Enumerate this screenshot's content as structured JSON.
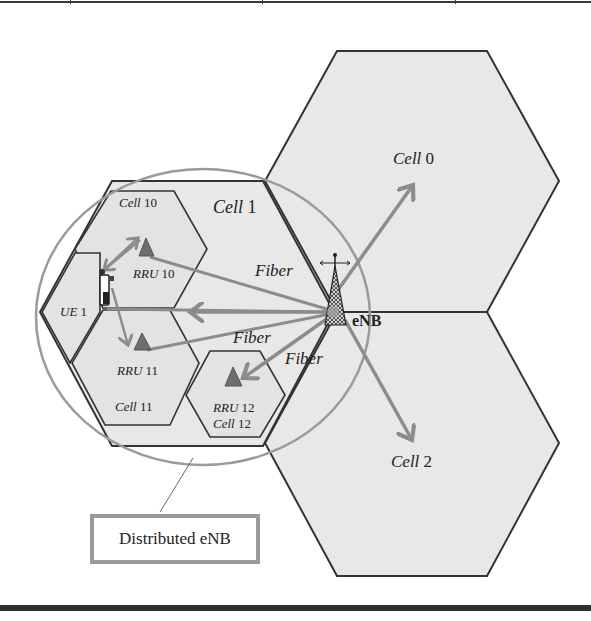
{
  "figure": {
    "colors": {
      "cell_fill": "#e8e8e8",
      "cell_border": "#333333",
      "arrow": "#8c8c8c",
      "circle": "#9a9a9a",
      "rru": "#6e6e6e",
      "text": "#222222"
    },
    "macro_cells": [
      {
        "id": "cell-0",
        "label_name": "Cell",
        "label_num": "0"
      },
      {
        "id": "cell-1",
        "label_name": "Cell",
        "label_num": "1"
      },
      {
        "id": "cell-2",
        "label_name": "Cell",
        "label_num": "2"
      }
    ],
    "small_cells": [
      {
        "id": "cell-10",
        "label_name": "Cell",
        "label_num": "10"
      },
      {
        "id": "cell-11",
        "label_name": "Cell",
        "label_num": "11"
      },
      {
        "id": "cell-12",
        "label_name": "Cell",
        "label_num": "12"
      }
    ],
    "rrus": [
      {
        "id": "rru-10",
        "label_name": "RRU",
        "label_num": "10"
      },
      {
        "id": "rru-11",
        "label_name": "RRU",
        "label_num": "11"
      },
      {
        "id": "rru-12",
        "label_name": "RRU",
        "label_num": "12"
      }
    ],
    "ue": {
      "label_name": "UE",
      "label_num": "1"
    },
    "enb": {
      "label": "eNB"
    },
    "fiber_labels": [
      "Fiber",
      "Fiber",
      "Fiber"
    ],
    "callout": {
      "label": "Distributed eNB"
    }
  }
}
